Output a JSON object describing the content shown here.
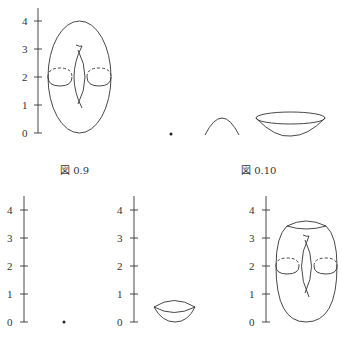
{
  "figures": [
    {
      "id": "fig-0-9",
      "caption": "図 0.9",
      "axis": {
        "ticks": [
          "0",
          "1",
          "2",
          "3",
          "4"
        ]
      },
      "shape": "torus with height function level circles at 2"
    },
    {
      "id": "fig-0-10",
      "caption": "図 0.10",
      "shapes": [
        "point",
        "arch",
        "bowl"
      ]
    }
  ],
  "bottom_row": [
    {
      "axis": {
        "ticks": [
          "0",
          "1",
          "2",
          "3",
          "4"
        ]
      },
      "shape": "point"
    },
    {
      "axis": {
        "ticks": [
          "0",
          "1",
          "2",
          "3",
          "4"
        ]
      },
      "shape": "lens"
    },
    {
      "axis": {
        "ticks": [
          "0",
          "1",
          "2",
          "3",
          "4"
        ]
      },
      "shape": "torus with cap cut"
    }
  ]
}
